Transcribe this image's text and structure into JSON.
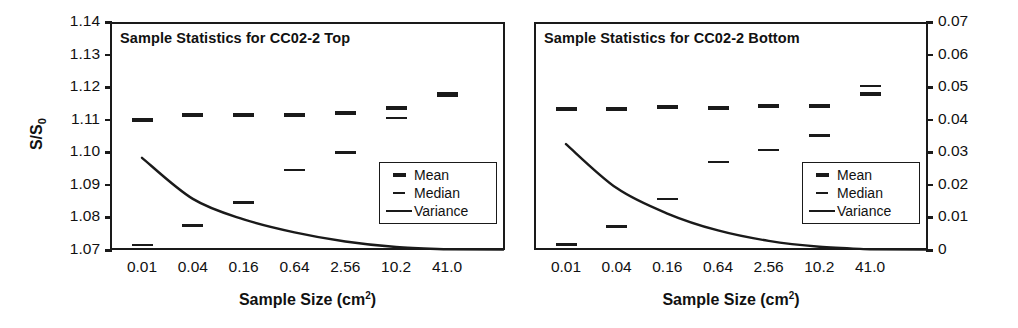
{
  "figure": {
    "width": 1018,
    "height": 328,
    "background": "#ffffff",
    "ink_color": "#1a1a1a"
  },
  "shared": {
    "xaxis_title_main": "Sample Size (cm",
    "xaxis_title_sup": "2",
    "xaxis_title_close": ")",
    "xaxis_title_full": "Sample Size (cm²)",
    "categories": [
      "0.01",
      "0.04",
      "0.16",
      "0.64",
      "2.56",
      "10.2",
      "41.0"
    ],
    "legend": {
      "items": [
        {
          "label": "Mean",
          "key": "mean-dash-key"
        },
        {
          "label": "Median",
          "key": "median-dash-key"
        },
        {
          "label": "Variance",
          "key": "variance-line-key"
        }
      ]
    }
  },
  "left_panel": {
    "title": "Sample Statistics for CC02-2 Top",
    "yaxis_label_main": "S/S",
    "yaxis_label_sub": "0",
    "yaxis_label_full": "S/S₀",
    "yticks": [
      "1.14",
      "1.13",
      "1.12",
      "1.11",
      "1.10",
      "1.09",
      "1.08",
      "1.07"
    ]
  },
  "right_panel": {
    "title": "Sample Statistics for CC02-2 Bottom",
    "yticks": [
      "0.07",
      "0.06",
      "0.05",
      "0.04",
      "0.03",
      "0.02",
      "0.01",
      "0"
    ]
  },
  "chart_data": [
    {
      "id": "cc02-2-top",
      "type": "scatter",
      "title": "Sample Statistics for CC02-2 Top",
      "xlabel": "Sample Size (cm²)",
      "ylabel": "S/S₀",
      "categories": [
        "0.01",
        "0.04",
        "0.16",
        "0.64",
        "2.56",
        "10.2",
        "41.0"
      ],
      "xlim_categorical": true,
      "ylim": [
        1.07,
        1.14
      ],
      "ylim_secondary": [
        0,
        0.07
      ],
      "yticks": [
        1.07,
        1.08,
        1.09,
        1.1,
        1.11,
        1.12,
        1.13,
        1.14
      ],
      "grid": false,
      "legend_position": "lower-right",
      "series": [
        {
          "name": "Mean",
          "axis": "left",
          "marker": "thick-dash",
          "values": [
            1.11,
            1.1115,
            1.1115,
            1.1115,
            1.112,
            1.1135,
            1.118
          ]
        },
        {
          "name": "Median",
          "axis": "left",
          "marker": "thin-dash",
          "values": [
            1.0715,
            1.0775,
            1.0845,
            1.0945,
            1.1,
            1.1105,
            1.1175
          ]
        },
        {
          "name": "Variance",
          "axis": "right",
          "marker": "line",
          "values": [
            0.0283,
            0.0157,
            0.0094,
            0.0054,
            0.0026,
            0.0009,
            0.0002
          ]
        }
      ]
    },
    {
      "id": "cc02-2-bottom",
      "type": "scatter",
      "title": "Sample Statistics for CC02-2 Bottom",
      "xlabel": "Sample Size (cm²)",
      "ylabel": "",
      "ylabel_secondary": "Variance",
      "categories": [
        "0.01",
        "0.04",
        "0.16",
        "0.64",
        "2.56",
        "10.2",
        "41.0"
      ],
      "xlim_categorical": true,
      "ylim": [
        1.07,
        1.14
      ],
      "ylim_secondary": [
        0,
        0.07
      ],
      "yticks_secondary": [
        0,
        0.01,
        0.02,
        0.03,
        0.04,
        0.05,
        0.06,
        0.07
      ],
      "grid": false,
      "legend_position": "lower-right",
      "series": [
        {
          "name": "Mean",
          "axis": "right",
          "marker": "thick-dash",
          "values": [
            0.0432,
            0.0432,
            0.044,
            0.0437,
            0.0442,
            0.0443,
            0.0478
          ]
        },
        {
          "name": "Median",
          "axis": "right",
          "marker": "thin-dash",
          "values": [
            0.0016,
            0.0072,
            0.0157,
            0.027,
            0.0307,
            0.0352,
            0.0503
          ]
        },
        {
          "name": "Variance",
          "axis": "right",
          "marker": "line",
          "values": [
            0.0325,
            0.019,
            0.0112,
            0.006,
            0.0028,
            0.001,
            0.0002
          ]
        }
      ]
    }
  ]
}
